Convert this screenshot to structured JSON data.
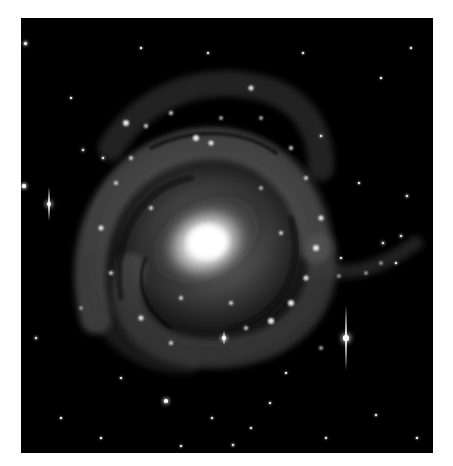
{
  "image": {
    "subject": "spiral galaxy",
    "description": "Grayscale telescope image of a face-on barred spiral galaxy with bright core, dusty spiral arms, and foreground stars on black background"
  },
  "colors": {
    "background": "#ffffff",
    "sky": "#000000",
    "core": "#ffffff"
  },
  "stars": [
    {
      "x": 4,
      "y": 25,
      "r": 1.5
    },
    {
      "x": 28,
      "y": 186,
      "r": 2.2,
      "spike": 34
    },
    {
      "x": 3,
      "y": 168,
      "r": 1.6
    },
    {
      "x": 325,
      "y": 320,
      "r": 2.6,
      "spike": 66
    },
    {
      "x": 203,
      "y": 320,
      "r": 1.8,
      "spike": 14
    },
    {
      "x": 15,
      "y": 320,
      "r": 1.2
    },
    {
      "x": 145,
      "y": 383,
      "r": 1.8
    },
    {
      "x": 62,
      "y": 132,
      "r": 1.3
    },
    {
      "x": 82,
      "y": 140,
      "r": 1.2
    },
    {
      "x": 187,
      "y": 35,
      "r": 1.0
    },
    {
      "x": 282,
      "y": 35,
      "r": 1.0
    },
    {
      "x": 338,
      "y": 165,
      "r": 1.0
    },
    {
      "x": 386,
      "y": 178,
      "r": 1.2
    },
    {
      "x": 390,
      "y": 30,
      "r": 0.9
    },
    {
      "x": 50,
      "y": 80,
      "r": 0.9
    },
    {
      "x": 305,
      "y": 420,
      "r": 0.9
    },
    {
      "x": 355,
      "y": 397,
      "r": 1.0
    },
    {
      "x": 230,
      "y": 410,
      "r": 1.0
    },
    {
      "x": 212,
      "y": 427,
      "r": 1.1
    },
    {
      "x": 249,
      "y": 385,
      "r": 1.0
    },
    {
      "x": 191,
      "y": 400,
      "r": 1.0
    },
    {
      "x": 160,
      "y": 428,
      "r": 1.0
    },
    {
      "x": 100,
      "y": 360,
      "r": 1.0
    },
    {
      "x": 265,
      "y": 355,
      "r": 0.9
    },
    {
      "x": 396,
      "y": 420,
      "r": 0.9
    },
    {
      "x": 375,
      "y": 245,
      "r": 1.0
    },
    {
      "x": 360,
      "y": 60,
      "r": 0.8
    },
    {
      "x": 120,
      "y": 30,
      "r": 0.8
    },
    {
      "x": 40,
      "y": 400,
      "r": 0.8
    },
    {
      "x": 80,
      "y": 420,
      "r": 0.8
    },
    {
      "x": 300,
      "y": 118,
      "r": 1.1
    },
    {
      "x": 320,
      "y": 240,
      "r": 1.0
    },
    {
      "x": 362,
      "y": 225,
      "r": 1.4
    },
    {
      "x": 380,
      "y": 218,
      "r": 1.2
    }
  ]
}
